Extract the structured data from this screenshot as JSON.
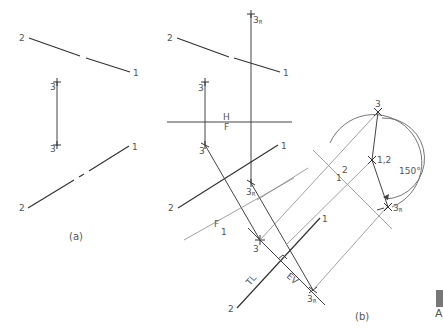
{
  "figure": {
    "panel_a": {
      "caption": "(a)",
      "top_line": {
        "label_left": "2",
        "label_right": "1"
      },
      "point_top": {
        "label": "3"
      },
      "point_bottom": {
        "label": "3"
      },
      "bottom_line": {
        "label_left": "2",
        "label_right": "1"
      }
    },
    "panel_b": {
      "caption": "(b)",
      "top_line": {
        "label_left": "2",
        "label_right": "1"
      },
      "point_3r_top": {
        "label": "3",
        "sub": "R"
      },
      "point_3_top": {
        "label": "3"
      },
      "fold_line_hf": {
        "upper": "H",
        "lower": "F"
      },
      "point_3_front": {
        "label": "3"
      },
      "point_3r_front": {
        "label": "3",
        "sub": "R"
      },
      "front_line": {
        "label_left": "2",
        "label_right": "1"
      },
      "fold_line_f1": {
        "upper": "F",
        "lower": "1"
      },
      "point_3_aux1": {
        "label": "3"
      },
      "aux1_line": {
        "label_left": "2",
        "label_right": "1",
        "tl_label": "TL"
      },
      "ev_label": "EV",
      "point_3r_aux1": {
        "label": "3",
        "sub": "R"
      },
      "fold_line_12": {
        "upper": "1",
        "lower": "2"
      },
      "point_3_aux2": {
        "label": "3"
      },
      "point_12_aux2": {
        "label": "1,2"
      },
      "point_3r_aux2": {
        "label": "3",
        "sub": "R"
      },
      "rotation_angle": "150°"
    },
    "edge_fragment": {
      "letter": "A"
    }
  }
}
